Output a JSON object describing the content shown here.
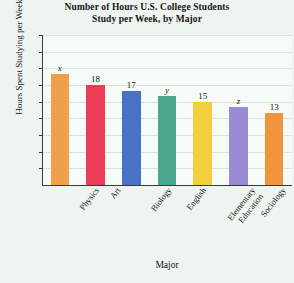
{
  "chart_data": {
    "type": "bar",
    "title": "Number of Hours U.S. College Students Study per Week, by Major",
    "title_lines": [
      "Number of Hours U.S. College Students",
      "Study per Week, by Major"
    ],
    "xlabel": "Major",
    "ylabel": "Hours Spent Studying per Week",
    "ylim": [
      0,
      27
    ],
    "ytick_step": 3,
    "yticks": [
      3,
      6,
      9,
      12,
      15,
      18,
      21,
      24,
      27
    ],
    "grid": "horizontal",
    "legend": "none",
    "categories": [
      "Physics",
      "Art",
      "Biology",
      "English",
      "Elementary Education",
      "Sociology",
      "Communications"
    ],
    "category_label_lines": [
      [
        "Physics"
      ],
      [
        "Art"
      ],
      [
        "Biology"
      ],
      [
        "English"
      ],
      [
        "Elementary",
        "Education"
      ],
      [
        "Sociology"
      ],
      [
        "Communications"
      ]
    ],
    "values": [
      20,
      18,
      17,
      16,
      15,
      14,
      13
    ],
    "data_labels": [
      "x",
      "18",
      "17",
      "y",
      "15",
      "z",
      "13"
    ],
    "data_label_italic": [
      true,
      false,
      false,
      true,
      false,
      true,
      false
    ],
    "bar_colors": [
      "#f0a04b",
      "#e93c56",
      "#4a72c4",
      "#4aa68c",
      "#f5ce3e",
      "#9b8bd6",
      "#f0943e"
    ],
    "plot_background": "#f7fbf8",
    "page_background": "#eef5f1",
    "gridline_color": "#d6e4dd",
    "axis_color": "#3a3a3a"
  }
}
